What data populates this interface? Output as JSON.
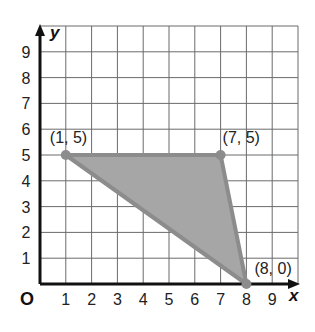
{
  "diagram": {
    "type": "coordinate-plane",
    "axes": {
      "x_label": "x",
      "y_label": "y",
      "origin_label": "O",
      "x_ticks": [
        "1",
        "2",
        "3",
        "4",
        "5",
        "6",
        "7",
        "8",
        "9"
      ],
      "y_ticks": [
        "1",
        "2",
        "3",
        "4",
        "5",
        "6",
        "7",
        "8",
        "9"
      ]
    },
    "shape": {
      "type": "triangle",
      "fill": "#a6a6a6",
      "stroke": "#8c8c8c",
      "vertices": [
        {
          "x": 1,
          "y": 5,
          "label": "(1, 5)"
        },
        {
          "x": 7,
          "y": 5,
          "label": "(7, 5)"
        },
        {
          "x": 8,
          "y": 0,
          "label": "(8, 0)"
        }
      ]
    }
  }
}
